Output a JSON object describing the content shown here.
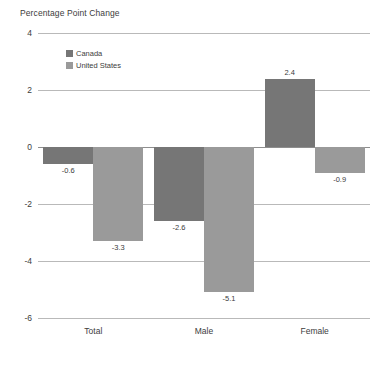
{
  "chart_data": {
    "type": "bar",
    "title": "Percentage Point Change",
    "xlabel": "",
    "ylabel": "Percentage Point Change",
    "categories": [
      "Total",
      "Male",
      "Female"
    ],
    "series": [
      {
        "name": "Canada",
        "color": "#767676",
        "values": [
          -0.6,
          -2.6,
          2.4
        ]
      },
      {
        "name": "United States",
        "color": "#9a9a9a",
        "values": [
          -3.3,
          -5.1,
          -0.9
        ]
      }
    ],
    "value_labels": [
      [
        "-0.6",
        "-2.6",
        "2.4"
      ],
      [
        "-3.3",
        "-5.1",
        "-0.9"
      ]
    ],
    "ylim": [
      -6,
      4
    ],
    "yticks": [
      4,
      2,
      0,
      -2,
      -4,
      -6
    ],
    "ytick_labels": [
      "4",
      "2",
      "0",
      "-2",
      "-4",
      "-6"
    ],
    "grid": true,
    "legend_position": "top-left-inside",
    "zero_line": 0,
    "background_color": "#ffffff",
    "gridline_color": "#b9b9b9",
    "zero_line_color": "#8e8e8e"
  },
  "legend": {
    "items": [
      {
        "label": "Canada",
        "color": "#767676"
      },
      {
        "label": "United States",
        "color": "#9a9a9a"
      }
    ]
  }
}
